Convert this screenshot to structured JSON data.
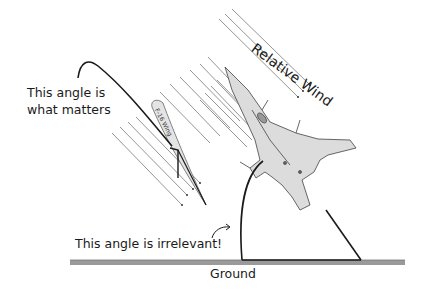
{
  "diagram": {
    "labels": {
      "angle_matters": [
        "This angle is",
        "what matters"
      ],
      "angle_irrelevant": "This angle is irrelevant!",
      "ground": "Ground",
      "relative_wind": "Relative Wind",
      "wing": "F-16 Wing"
    },
    "elements": [
      "relative-wind-lines-near-wing",
      "relative-wind-lines-near-jet",
      "f16-wing-airfoil",
      "angle-of-attack-arc",
      "f16-jet-sketch",
      "pitch-angle-arc",
      "ground-hatch"
    ],
    "colors": {
      "ink": "#1a1a1a",
      "wind_lines": "#777777",
      "wing_fill": "#e4e4e4",
      "jet_fill": "#dcdcdc",
      "ground": "#8a8a8a"
    }
  }
}
